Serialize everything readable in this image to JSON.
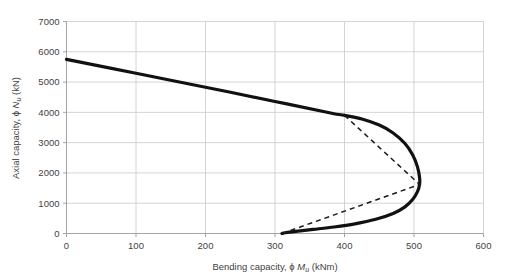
{
  "chart_data": {
    "type": "line",
    "title": "",
    "xlabel": "Bending capacity, ϕ Mu (kNm)",
    "ylabel": "Axial capacity, ϕ Nu (kN)",
    "xlim": [
      0,
      600
    ],
    "ylim": [
      0,
      7000
    ],
    "xticks": [
      0,
      100,
      200,
      300,
      400,
      500,
      600
    ],
    "yticks": [
      0,
      1000,
      2000,
      3000,
      4000,
      5000,
      6000,
      7000
    ],
    "grid": true,
    "legend": "none",
    "series": [
      {
        "name": "Design interaction curve (solid)",
        "style": "solid",
        "color": "#111111",
        "points": [
          [
            0,
            5750
          ],
          [
            100,
            5290
          ],
          [
            200,
            4830
          ],
          [
            300,
            4360
          ],
          [
            380,
            3980
          ],
          [
            400,
            3900
          ],
          [
            425,
            3780
          ],
          [
            450,
            3580
          ],
          [
            470,
            3320
          ],
          [
            487,
            2970
          ],
          [
            498,
            2600
          ],
          [
            505,
            2200
          ],
          [
            508,
            1850
          ],
          [
            508,
            1620
          ],
          [
            505,
            1380
          ],
          [
            498,
            1120
          ],
          [
            487,
            880
          ],
          [
            470,
            660
          ],
          [
            445,
            470
          ],
          [
            415,
            320
          ],
          [
            385,
            215
          ],
          [
            355,
            135
          ],
          [
            330,
            70
          ],
          [
            315,
            25
          ],
          [
            310,
            0
          ]
        ]
      },
      {
        "name": "Simplified bilinear approximation (dashed)",
        "style": "dashed",
        "color": "#1a1a1a",
        "points": [
          [
            400,
            3900
          ],
          [
            508,
            1620
          ],
          [
            310,
            0
          ]
        ]
      }
    ],
    "annotations": {
      "axial_intercept_kN": 5750,
      "balance_point": [
        508,
        1620
      ],
      "pure_bending_kNm": 310,
      "squash_transition": [
        400,
        3900
      ]
    }
  },
  "axis": {
    "x_tick_labels": [
      "0",
      "100",
      "200",
      "300",
      "400",
      "500",
      "600"
    ],
    "y_tick_labels": [
      "0",
      "1000",
      "2000",
      "3000",
      "4000",
      "5000",
      "6000",
      "7000"
    ],
    "x_title_pre": "Bending capacity, ",
    "x_title_phi": "ϕ ",
    "x_title_sym": "M",
    "x_title_sub": "u",
    "x_title_post": " (kNm)",
    "y_title_pre": "Axial capacity, ",
    "y_title_phi": "ϕ ",
    "y_title_sym": "N",
    "y_title_sub": "u",
    "y_title_post": " (kN)"
  }
}
